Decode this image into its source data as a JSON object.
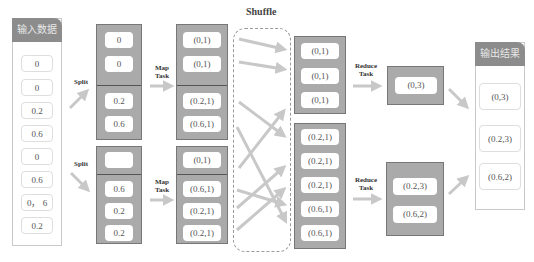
{
  "title": "Shuffle",
  "input": {
    "header": "输入数据",
    "items": [
      "0",
      "0",
      "0.2",
      "0.6",
      "0",
      "0.6",
      "0， 6",
      "0.2"
    ]
  },
  "output": {
    "header": "输出结果",
    "items": [
      "(0,3)",
      "(0.2,3)",
      "(0.6,2)"
    ]
  },
  "labels": {
    "split_top": "Split",
    "split_bottom": "Split",
    "map_top": [
      "Map",
      "Task"
    ],
    "map_bottom": [
      "Map",
      "Task"
    ],
    "reduce_top": [
      "Reduce",
      "Task"
    ],
    "reduce_bottom": [
      "Reduce",
      "Task"
    ]
  },
  "splits": {
    "top": {
      "group1": [
        "0",
        "0"
      ],
      "group2": [
        "0.2",
        "0.6"
      ]
    },
    "bottom": {
      "group1": [
        ""
      ],
      "group2": [
        "0.6",
        "0.2",
        "0.2"
      ]
    }
  },
  "maps": {
    "top": {
      "group1": [
        "(0,1)",
        "(0,1)"
      ],
      "group2": [
        "(0.2,1)",
        "(0.6,1)"
      ]
    },
    "bottom": {
      "group1": [
        "(0,1)"
      ],
      "group2": [
        "(0.6,1)",
        "(0.2,1)",
        "(0.2,1)"
      ]
    }
  },
  "shuffled": {
    "top": [
      "(0,1)",
      "(0,1)",
      "(0,1)"
    ],
    "bottom": [
      "(0.2,1)",
      "(0.2,1)",
      "(0.2,1)",
      "(0.6,1)",
      "(0.6,1)"
    ]
  },
  "reduced": {
    "top": [
      "(0,3)"
    ],
    "bottom": [
      "(0.2,3)",
      "(0.6,2)"
    ]
  },
  "colors": {
    "box_fill": "#aaaaaa",
    "header_fill": "#8c8c8c",
    "arrow": "#c8c8c8"
  }
}
